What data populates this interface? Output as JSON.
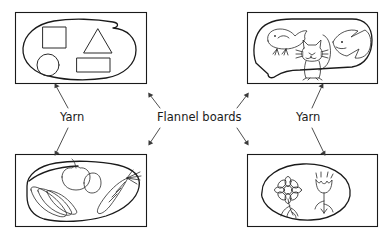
{
  "diagram": {
    "type": "labeled-illustration",
    "labels": {
      "flannel_boards": "Flannel boards",
      "yarn_left": "Yarn",
      "yarn_right": "Yarn"
    },
    "boards": [
      {
        "id": "board-top-left",
        "position": "top-left",
        "theme": "geometric shapes",
        "figures": [
          "square",
          "triangle",
          "circle",
          "rectangle"
        ]
      },
      {
        "id": "board-top-right",
        "position": "top-right",
        "theme": "animals",
        "figures": [
          "bird",
          "cat",
          "fish"
        ]
      },
      {
        "id": "board-bottom-left",
        "position": "bottom-left",
        "theme": "foods",
        "figures": [
          "bananas",
          "apple",
          "lemon",
          "carrot"
        ]
      },
      {
        "id": "board-bottom-right",
        "position": "bottom-right",
        "theme": "flowers",
        "figures": [
          "daisy",
          "tulip"
        ]
      }
    ],
    "callouts": [
      {
        "label_key": "flannel_boards",
        "points_to": "board-top-left"
      },
      {
        "label_key": "flannel_boards",
        "points_to": "board-top-right"
      },
      {
        "label_key": "flannel_boards",
        "points_to": "board-bottom-left"
      },
      {
        "label_key": "flannel_boards",
        "points_to": "board-bottom-right"
      },
      {
        "label_key": "yarn_left",
        "points_to": "board-top-left"
      },
      {
        "label_key": "yarn_left",
        "points_to": "board-bottom-left"
      },
      {
        "label_key": "yarn_right",
        "points_to": "board-top-right"
      },
      {
        "label_key": "yarn_right",
        "points_to": "board-bottom-right"
      }
    ],
    "colors": {
      "background": "#ffffff",
      "frame_stroke": "#1a1a1a",
      "yarn_stroke": "#1a1a1a",
      "figure_stroke": "#2a2a2a",
      "leader_stroke": "#3a3a3a",
      "text": "#1a1a1a"
    }
  }
}
